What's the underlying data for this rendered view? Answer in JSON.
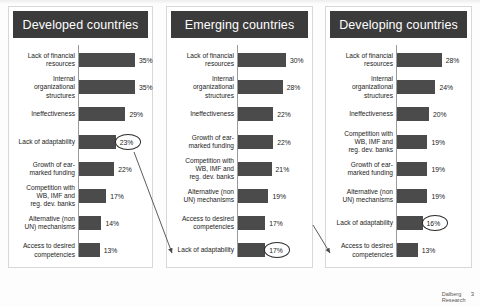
{
  "slide": {
    "footer": {
      "logo_line1": "Dalberg",
      "logo_line2": "Research",
      "page_number": "3"
    },
    "colors": {
      "title_bar": "#3b3b3b",
      "bar_fill": "#4b4b4b",
      "axis": "#9a9a9a",
      "panel_border": "#d8d8d8",
      "page_background": "#fdfdfd"
    }
  },
  "chart_data": [
    {
      "type": "bar",
      "title": "Developed countries",
      "orientation": "horizontal",
      "xlabel": "",
      "ylabel": "",
      "grid": false,
      "legend": "none",
      "value_suffix": "%",
      "xlim": [
        0,
        40
      ],
      "categories": [
        "Lack of financial\nresources",
        "Internal\norganizational\nstructures",
        "Ineffectiveness",
        "Lack of adaptability",
        "Growth of ear-\nmarked funding",
        "Competition with\nWB, IMF and\nreg. dev. banks",
        "Alternative (non\nUN) mechanisms",
        "Access to desired\ncompetencies"
      ],
      "values": [
        35,
        35,
        29,
        23,
        22,
        17,
        14,
        13
      ],
      "labels": [
        "35%",
        "35%",
        "29%",
        "23%",
        "22%",
        "17%",
        "14%",
        "13%"
      ],
      "highlighted_index": 3,
      "annotations": [
        "Lack of adaptability highlighted at 23%"
      ]
    },
    {
      "type": "bar",
      "title": "Emerging countries",
      "orientation": "horizontal",
      "xlabel": "",
      "ylabel": "",
      "grid": false,
      "legend": "none",
      "value_suffix": "%",
      "xlim": [
        0,
        40
      ],
      "categories": [
        "Lack of financial\nresources",
        "Internal\norganizational\nstructures",
        "Ineffectiveness",
        "Growth of ear-\nmarked funding",
        "Competition with\nWB, IMF and\nreg. dev. banks",
        "Alternative (non\nUN) mechanisms",
        "Access to desired\ncompetencies",
        "Lack of adaptability"
      ],
      "values": [
        30,
        28,
        22,
        22,
        21,
        19,
        17,
        17
      ],
      "labels": [
        "30%",
        "28%",
        "22%",
        "22%",
        "21%",
        "19%",
        "17%",
        "17%"
      ],
      "highlighted_index": 7,
      "annotations": [
        "Lack of adaptability highlighted at 17%"
      ]
    },
    {
      "type": "bar",
      "title": "Developing countries",
      "orientation": "horizontal",
      "xlabel": "",
      "ylabel": "",
      "grid": false,
      "legend": "none",
      "value_suffix": "%",
      "xlim": [
        0,
        40
      ],
      "categories": [
        "Lack of financial\nresources",
        "Internal\norganizational\nstructures",
        "Ineffectiveness",
        "Competition with\nWB, IMF and\nreg. dev. banks",
        "Growth of ear-\nmarked funding",
        "Alternative (non\nUN) mechanisms",
        "Lack of adaptability",
        "Access to desired\ncompetencies"
      ],
      "values": [
        28,
        24,
        20,
        19,
        19,
        19,
        16,
        13
      ],
      "labels": [
        "28%",
        "24%",
        "20%",
        "19%",
        "19%",
        "19%",
        "16%",
        "13%"
      ],
      "highlighted_index": 6,
      "annotations": [
        "Lack of adaptability highlighted at 16%"
      ]
    }
  ]
}
